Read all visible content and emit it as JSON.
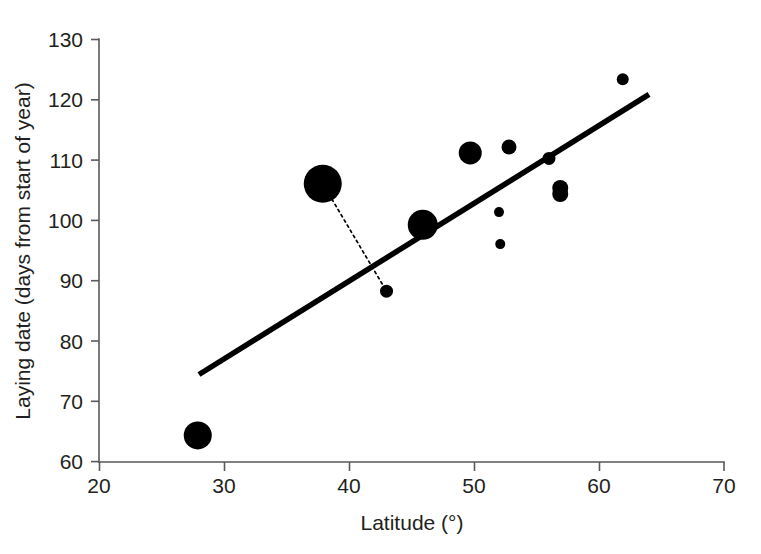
{
  "chart_data": {
    "type": "scatter",
    "title": "",
    "xlabel": "Latitude (°)",
    "ylabel": "Laying date (days from start of year)",
    "xlim": [
      20,
      70
    ],
    "ylim": [
      60,
      130
    ],
    "xticks": [
      20,
      30,
      40,
      50,
      60,
      70
    ],
    "yticks": [
      60,
      70,
      80,
      90,
      100,
      110,
      120,
      130
    ],
    "xtick_labels": [
      "20",
      "30",
      "40",
      "50",
      "60",
      "70"
    ],
    "ytick_labels": [
      "60",
      "70",
      "80",
      "90",
      "100",
      "110",
      "120",
      "130"
    ],
    "grid": false,
    "legend": "none",
    "marker": "filled-circle",
    "marker_color": "#000000",
    "note": "Marker area is proportional to sample weight; a dotted segment links two observations from the same population.",
    "points": [
      {
        "x": 27.9,
        "y": 64.4,
        "size": 14.0
      },
      {
        "x": 37.9,
        "y": 106.1,
        "size": 19.0
      },
      {
        "x": 43.0,
        "y": 88.3,
        "size": 6.5
      },
      {
        "x": 45.9,
        "y": 99.3,
        "size": 15.0
      },
      {
        "x": 49.7,
        "y": 111.2,
        "size": 11.5
      },
      {
        "x": 52.0,
        "y": 101.4,
        "size": 5.0
      },
      {
        "x": 52.1,
        "y": 96.1,
        "size": 5.0
      },
      {
        "x": 52.8,
        "y": 112.2,
        "size": 7.5
      },
      {
        "x": 56.0,
        "y": 110.3,
        "size": 6.5
      },
      {
        "x": 56.9,
        "y": 105.4,
        "size": 8.0
      },
      {
        "x": 56.9,
        "y": 104.4,
        "size": 8.0
      },
      {
        "x": 61.9,
        "y": 123.4,
        "size": 6.0
      }
    ],
    "trend_line": {
      "x_start": 28.0,
      "y_start": 74.5,
      "x_end": 64.0,
      "y_end": 120.9,
      "color": "#000000"
    },
    "connector": {
      "from_x": 37.9,
      "from_y": 106.1,
      "to_x": 43.0,
      "to_y": 88.3,
      "style": "dotted"
    }
  },
  "axis": {
    "x_title": "Latitude (°)",
    "y_title": "Laying date (days from start of year)"
  }
}
